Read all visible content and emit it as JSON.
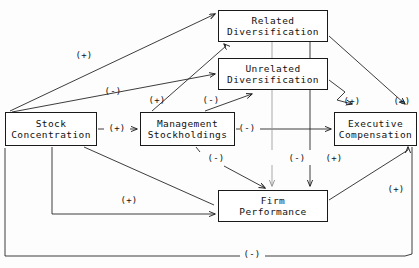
{
  "diagram": {
    "type": "path-diagram",
    "line_color": "#1a1a1a",
    "box_fill": "#ffffff",
    "nodes": [
      {
        "id": "stock_concentration",
        "label_line1": "Stock",
        "label_line2": "Concentration",
        "x": 5,
        "y": 112,
        "w": 92,
        "h": 34
      },
      {
        "id": "management_stockholdings",
        "label_line1": "Management",
        "label_line2": "Stockholdings",
        "x": 140,
        "y": 112,
        "w": 95,
        "h": 34
      },
      {
        "id": "related_diversification",
        "label_line1": "Related",
        "label_line2": "Diversification",
        "x": 218,
        "y": 10,
        "w": 110,
        "h": 32
      },
      {
        "id": "unrelated_diversification",
        "label_line1": "Unrelated",
        "label_line2": "Diversification",
        "x": 218,
        "y": 58,
        "w": 110,
        "h": 32
      },
      {
        "id": "executive_compensation",
        "label_line1": "Executive",
        "label_line2": "Compensation",
        "x": 334,
        "y": 112,
        "w": 83,
        "h": 34
      },
      {
        "id": "firm_performance",
        "label_line1": "Firm",
        "label_line2": "Performance",
        "x": 218,
        "y": 190,
        "w": 110,
        "h": 32
      }
    ],
    "signs": [
      {
        "id": "sign-sc-to-related",
        "text": "(+)",
        "x": 84,
        "y": 55
      },
      {
        "id": "sign-sc-to-unrelated",
        "text": "(-)",
        "x": 113,
        "y": 91
      },
      {
        "id": "sign-sc-to-management",
        "text": "(+)",
        "x": 117,
        "y": 128
      },
      {
        "id": "sign-ms-to-related",
        "text": "(+)",
        "x": 157,
        "y": 100
      },
      {
        "id": "sign-ms-to-unrelated",
        "text": "(-)",
        "x": 211,
        "y": 100
      },
      {
        "id": "sign-ms-to-exec",
        "text": "(-)",
        "x": 247,
        "y": 128
      },
      {
        "id": "sign-related-to-exec",
        "text": "(+)",
        "x": 352,
        "y": 101
      },
      {
        "id": "sign-unrelated-to-exec",
        "text": "(+)",
        "x": 402,
        "y": 101
      },
      {
        "id": "sign-ms-to-firm",
        "text": "(-)",
        "x": 216,
        "y": 158
      },
      {
        "id": "sign-diversification-firm",
        "text": "(-)",
        "x": 297,
        "y": 158
      },
      {
        "id": "sign-related-firm",
        "text": "(+)",
        "x": 334,
        "y": 158
      },
      {
        "id": "sign-sc-to-firm",
        "text": "(+)",
        "x": 129,
        "y": 200
      },
      {
        "id": "sign-firm-to-exec",
        "text": "(+)",
        "x": 396,
        "y": 189
      },
      {
        "id": "sign-feedback-loop",
        "text": "(-)",
        "x": 252,
        "y": 254
      }
    ]
  }
}
